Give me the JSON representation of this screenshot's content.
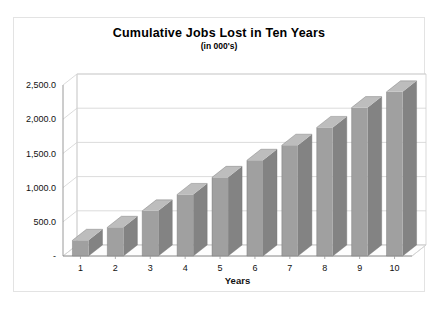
{
  "chart_data": {
    "type": "bar",
    "title": "Cumulative Jobs Lost in Ten Years",
    "subtitle": "(in 000's)",
    "xlabel": "Years",
    "ylabel": "",
    "categories": [
      "1",
      "2",
      "3",
      "4",
      "5",
      "6",
      "7",
      "8",
      "9",
      "10"
    ],
    "values": [
      230,
      420,
      660,
      900,
      1150,
      1400,
      1620,
      1880,
      2170,
      2400
    ],
    "ylim": [
      0,
      2500
    ],
    "ytick_values": [
      0,
      500,
      1000,
      1500,
      2000,
      2500
    ],
    "ytick_labels": [
      "-",
      "500.0",
      "1,000.0",
      "1,500.0",
      "2,000.0",
      "2,500.0"
    ],
    "grid": true,
    "legend": "none",
    "style": "3d-column",
    "series_name": "Cumulative Jobs Lost",
    "colors": {
      "bar_front": "#a0a0a0",
      "bar_side": "#838383",
      "bar_top": "#bdbdbd",
      "gridline": "#d2d2d2",
      "axis": "#8f8f8f",
      "border": "#e3e3e3",
      "background": "#ffffff",
      "text": "#111111"
    }
  }
}
